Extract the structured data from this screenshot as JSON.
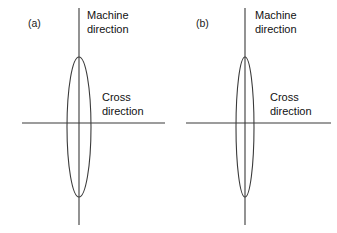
{
  "figure": {
    "width": 337,
    "height": 233,
    "background_color": "#ffffff",
    "line_color": "#3a3a3a",
    "text_color": "#111111"
  },
  "panels": [
    {
      "id": "a",
      "label": "(a)",
      "machine_direction_label_line1": "Machine",
      "machine_direction_label_line2": "direction",
      "cross_direction_label_line1": "Cross",
      "cross_direction_label_line2": "direction",
      "ellipse": {
        "center_x": 79,
        "center_y": 127,
        "radius_x": 12,
        "radius_y": 70,
        "orientation": "vertical"
      },
      "vertical_axis": {
        "x": 79,
        "y_top": 8,
        "y_bottom": 225
      },
      "horizontal_axis": {
        "y": 123,
        "x_left": 22,
        "x_right": 165
      }
    },
    {
      "id": "b",
      "label": "(b)",
      "machine_direction_label_line1": "Machine",
      "machine_direction_label_line2": "direction",
      "cross_direction_label_line1": "Cross",
      "cross_direction_label_line2": "direction",
      "ellipse": {
        "center_x": 77,
        "center_y": 127,
        "radius_x": 9,
        "radius_y": 70,
        "orientation": "vertical"
      },
      "vertical_axis": {
        "x": 77,
        "y_top": 8,
        "y_bottom": 225
      },
      "horizontal_axis": {
        "y": 123,
        "x_left": 18,
        "x_right": 163
      }
    }
  ]
}
